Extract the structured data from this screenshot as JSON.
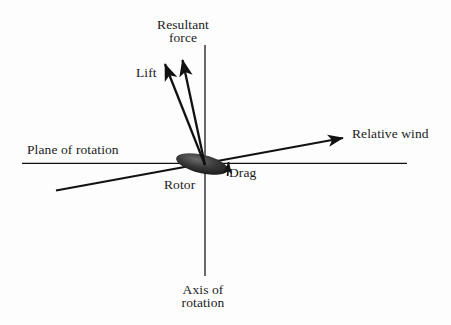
{
  "figure": {
    "background_color": "#fdfdfd",
    "line_color": "#111111",
    "text_color": "#1b1b1b"
  },
  "labels": {
    "resultant_force": "Resultant\nforce",
    "lift": "Lift",
    "relative_wind": "Relative wind",
    "plane_of_rotation": "Plane of rotation",
    "drag": "Drag",
    "rotor": "Rotor",
    "axis_of_rotation": "Axis of\nrotation"
  },
  "elements": {
    "axis_of_rotation_line": "vertical-axis-line",
    "plane_of_rotation_line": "horizontal-plane-line",
    "relative_wind_line": "relative-wind-arrow",
    "lift_vector": "lift-arrow",
    "resultant_force_vector": "resultant-force-arrow",
    "drag_vector": "drag-arrow",
    "rotor_blade": "rotor-ellipse"
  },
  "geometry": {
    "origin": {
      "x": 205,
      "y": 164
    },
    "vertical_axis": {
      "x1": 205,
      "y1": 45,
      "x2": 205,
      "y2": 276
    },
    "horizontal_plane": {
      "x1": 22,
      "y1": 163,
      "x2": 407,
      "y2": 163
    },
    "relative_wind": {
      "x1": 56,
      "y1": 190,
      "x2": 347,
      "y2": 137
    },
    "lift": {
      "x1": 205,
      "y1": 164,
      "x2": 163,
      "y2": 60
    },
    "resultant_force": {
      "x1": 205,
      "y1": 164,
      "x2": 181,
      "y2": 56
    },
    "drag": {
      "x1": 228,
      "y1": 176,
      "x2": 228,
      "y2": 159
    },
    "rotor": {
      "cx": 202,
      "cy": 164,
      "rx": 26,
      "ry": 9,
      "rotation_deg": 12
    }
  }
}
